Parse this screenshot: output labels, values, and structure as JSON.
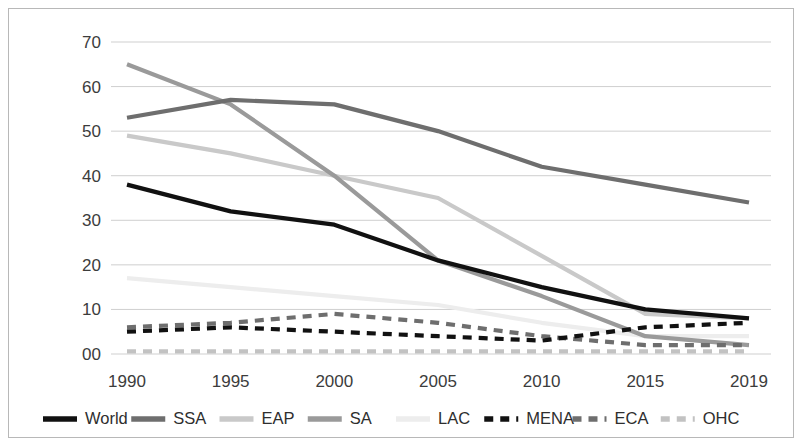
{
  "chart_data": {
    "type": "line",
    "title": "",
    "subtitle": "",
    "xlabel": "",
    "ylabel": "",
    "x": [
      1990,
      1995,
      2000,
      2005,
      2010,
      2015,
      2019
    ],
    "categories": [
      "1990",
      "1995",
      "2000",
      "2005",
      "2010",
      "2015",
      "2019"
    ],
    "xtick_labels": [
      "1990",
      "1995",
      "2000",
      "2005",
      "2010",
      "2015",
      "2019"
    ],
    "ytick_labels": [
      "00",
      "10",
      "20",
      "30",
      "40",
      "50",
      "60",
      "70"
    ],
    "ytick_values": [
      0,
      10,
      20,
      30,
      40,
      50,
      60,
      70
    ],
    "ylim": [
      0,
      70
    ],
    "grid": "horizontal",
    "legend_position": "bottom",
    "legend_entries": [
      "World",
      "SSA",
      "EAP",
      "SA",
      "LAC",
      "MENA",
      "ECA",
      "OHC"
    ],
    "series": [
      {
        "name": "World",
        "values": [
          38,
          32,
          29,
          21,
          15,
          10,
          8
        ],
        "color": "#111111",
        "style": "solid",
        "width": 4.2
      },
      {
        "name": "SSA",
        "values": [
          53,
          57,
          56,
          50,
          42,
          38,
          34
        ],
        "color": "#6e6e6e",
        "style": "solid",
        "width": 4.2
      },
      {
        "name": "EAP",
        "values": [
          49,
          45,
          40,
          35,
          22,
          9,
          8
        ],
        "color": "#c9c9c9",
        "style": "solid",
        "width": 4.2
      },
      {
        "name": "SA",
        "values": [
          65,
          56,
          40,
          21,
          13,
          4,
          2
        ],
        "color": "#9a9a9a",
        "style": "solid",
        "width": 4.2
      },
      {
        "name": "LAC",
        "values": [
          17,
          15,
          13,
          11,
          7,
          4,
          4
        ],
        "color": "#ededed",
        "style": "solid",
        "width": 4.2
      },
      {
        "name": "MENA",
        "values": [
          5,
          6,
          5,
          4,
          3,
          6,
          7
        ],
        "color": "#111111",
        "style": "dashed",
        "width": 4.2
      },
      {
        "name": "ECA",
        "values": [
          6,
          7,
          9,
          7,
          4,
          2,
          2
        ],
        "color": "#6e6e6e",
        "style": "dashed",
        "width": 4.2
      },
      {
        "name": "OHC",
        "values": [
          0.6,
          0.6,
          0.6,
          0.6,
          0.6,
          0.6,
          0.6
        ],
        "color": "#c2c2c2",
        "style": "dashed",
        "width": 4.2
      }
    ]
  }
}
